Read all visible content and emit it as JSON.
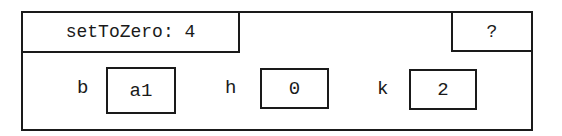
{
  "header": {
    "title": "setToZero: 4",
    "help_label": "?"
  },
  "fields": [
    {
      "label": "b",
      "value": "a1"
    },
    {
      "label": "h",
      "value": "0"
    },
    {
      "label": "k",
      "value": "2"
    }
  ],
  "colors": {
    "border": "#1a1a1a",
    "background": "#ffffff"
  }
}
